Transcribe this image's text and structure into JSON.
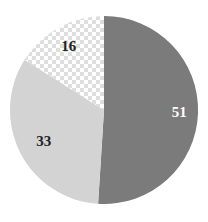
{
  "chart_data": {
    "type": "pie",
    "title": "",
    "categories": [
      "A",
      "B",
      "C"
    ],
    "values": [
      51,
      33,
      16
    ],
    "start_angle_deg": 0,
    "direction": "clockwise",
    "labels": [
      "51",
      "33",
      "16"
    ],
    "colors": [
      "#7b7b7b",
      "#d3d3d3",
      "checkered"
    ],
    "legend": "none",
    "grid": false
  },
  "style": {
    "center": [
      104,
      110
    ],
    "radius": 94,
    "label_radius": [
      0.8,
      0.72,
      0.78
    ],
    "label_colors": [
      "#ffffff",
      "#222222",
      "#222222"
    ],
    "checker_light": "#ffffff",
    "checker_dark": "#dedede",
    "checker_size": 4
  }
}
